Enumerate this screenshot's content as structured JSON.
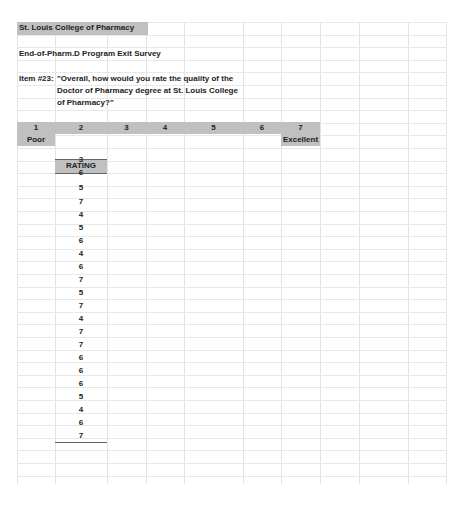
{
  "spreadsheet": {
    "title": "St. Louis College of Pharmacy",
    "subtitle": "End-of-Pharm.D Program Exit Survey",
    "item_label": "Item #23:",
    "item_question": [
      "\"Overall, how would you rate the quality of the",
      "Doctor of Pharmacy degree at St. Louis College",
      "of Pharmacy?\""
    ],
    "scale": [
      "1",
      "2",
      "3",
      "4",
      "5",
      "6",
      "7"
    ],
    "scale_low_label": "Poor",
    "scale_high_label": "Excellent",
    "rating_header": "RATING",
    "ratings": [
      "3",
      "6",
      "5",
      "7",
      "4",
      "5",
      "6",
      "4",
      "6",
      "7",
      "5",
      "7",
      "4",
      "7",
      "7",
      "6",
      "6",
      "6",
      "5",
      "4",
      "6",
      "7"
    ]
  },
  "colors": {
    "header_fill": "#c0c0c0",
    "gridline": "#e3e3e3"
  }
}
